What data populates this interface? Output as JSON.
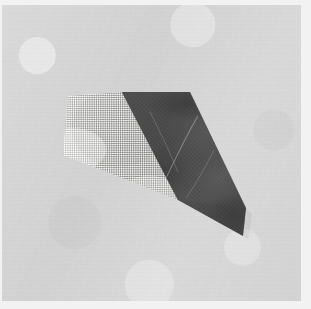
{
  "figure": {
    "caption": "",
    "width_px": 311,
    "height_px": 309,
    "medium": "scanned printed halftone illustration"
  },
  "background": {
    "name": "paper-background",
    "color": "#d6d6d6",
    "texture": "mottled paper grain",
    "edge_strip_color": "#f2f2f2",
    "edge_top_px": 5,
    "edge_bottom_px": 8,
    "edge_right_px": 10,
    "edge_left_px": 2
  },
  "shape": {
    "name": "angular-polygon",
    "description": "Two-faced angular polygonal form, lit face screened with a halftone dot pattern and shadow face printed solid dark",
    "outline_points": "68,96 190,92 246,208 243,236 178,200 63,155",
    "divider": {
      "from": "122,92",
      "to": "178,200"
    },
    "faces": [
      {
        "id": "light-face",
        "name": "halftone-dotted-face",
        "fill_style": "halftone dot screen",
        "points": "68,96 122,92 178,200 63,155",
        "base_color": "#f3f3f1",
        "dot_color": "#5a5a5a",
        "dot_pitch_px": 3.1,
        "dot_radius_px": 0.72,
        "screen_angle_deg": 45
      },
      {
        "id": "dark-face",
        "name": "solid-dark-face",
        "fill_style": "dense dark grain",
        "points": "122,92 190,92 246,208 243,236 178,200",
        "base_color": "#4d4d4d",
        "grain_color": "#2e2e2e",
        "highlight_color": "#6b6b6b",
        "crease": "from 196,118 to 166,176"
      }
    ],
    "vertices": [
      {
        "name": "top-left-vertex",
        "x": 68,
        "y": 96
      },
      {
        "name": "ridge-top-vertex",
        "x": 122,
        "y": 92
      },
      {
        "name": "top-right-vertex",
        "x": 190,
        "y": 92
      },
      {
        "name": "right-vertex",
        "x": 246,
        "y": 208
      },
      {
        "name": "bottom-tip-vertex",
        "x": 243,
        "y": 236
      },
      {
        "name": "ridge-bottom-vertex",
        "x": 178,
        "y": 200
      },
      {
        "name": "left-vertex",
        "x": 63,
        "y": 155
      }
    ]
  }
}
